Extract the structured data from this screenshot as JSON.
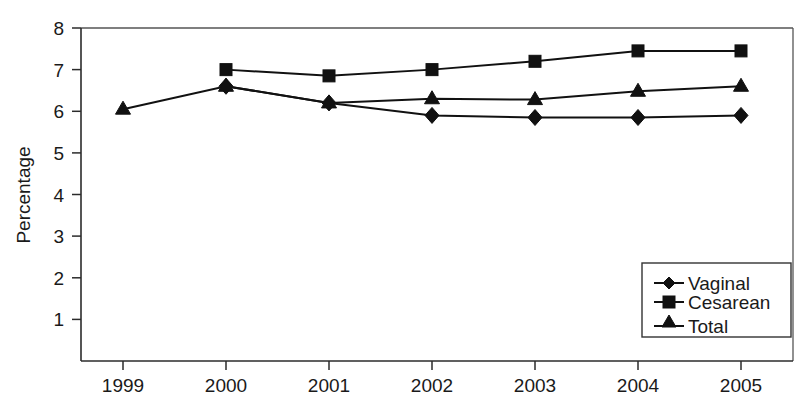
{
  "chart_data": {
    "type": "line",
    "title": "",
    "xlabel": "",
    "ylabel": "Percentage",
    "categories": [
      "1999",
      "2000",
      "2001",
      "2002",
      "2003",
      "2004",
      "2005"
    ],
    "xlim": [
      1998.5,
      2005.5
    ],
    "ylim": [
      0,
      8
    ],
    "yticks": [
      1,
      2,
      3,
      4,
      5,
      6,
      7,
      8
    ],
    "ytick_labels": [
      "1",
      "2",
      "3",
      "4",
      "5",
      "6",
      "7",
      "8"
    ],
    "grid": false,
    "legend_position": "bottom-right",
    "series": [
      {
        "name": "Vaginal",
        "marker": "diamond",
        "values": [
          null,
          6.6,
          6.2,
          5.9,
          5.85,
          5.85,
          5.9
        ]
      },
      {
        "name": "Cesarean",
        "marker": "square",
        "values": [
          null,
          7.0,
          6.85,
          7.0,
          7.2,
          7.45,
          7.45
        ]
      },
      {
        "name": "Total",
        "marker": "triangle",
        "values": [
          6.05,
          6.6,
          6.2,
          6.3,
          6.28,
          6.48,
          6.6
        ]
      }
    ],
    "colors": {
      "series": "#111111",
      "axis": "#2b2b2b",
      "background": "#ffffff"
    }
  },
  "axis": {
    "y_title": "Percentage",
    "y_ticks": [
      "8",
      "7",
      "6",
      "5",
      "4",
      "3",
      "2",
      "1"
    ],
    "x_ticks": [
      "1999",
      "2000",
      "2001",
      "2002",
      "2003",
      "2004",
      "2005"
    ]
  },
  "legend": {
    "entries": [
      {
        "label": "Vaginal",
        "marker": "diamond-marker-icon"
      },
      {
        "label": "Cesarean",
        "marker": "square-marker-icon"
      },
      {
        "label": "Total",
        "marker": "triangle-marker-icon"
      }
    ]
  },
  "caption": {
    "text": ""
  }
}
